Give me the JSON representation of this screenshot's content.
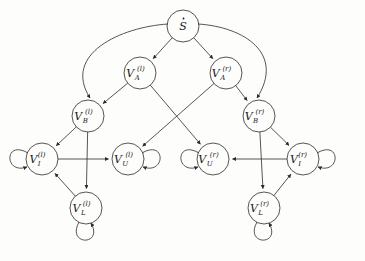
{
  "diagram": {
    "type": "directed-graph",
    "background_color": "#fdfdfc",
    "stroke_color": "#2b2b2b",
    "nodes": [
      {
        "id": "S",
        "label_main": "S",
        "label_sub": "",
        "label_sup": "",
        "accent": "dot",
        "cx": 183,
        "cy": 26,
        "r": 16
      },
      {
        "id": "Al",
        "label_main": "V",
        "label_sub": "A",
        "label_sup": "(l)",
        "accent": "",
        "cx": 140,
        "cy": 73,
        "r": 16
      },
      {
        "id": "Ar",
        "label_main": "V",
        "label_sub": "A",
        "label_sup": "(r)",
        "accent": "",
        "cx": 226,
        "cy": 73,
        "r": 16
      },
      {
        "id": "Bl",
        "label_main": "V",
        "label_sub": "B",
        "label_sup": "(l)",
        "accent": "",
        "cx": 88,
        "cy": 116,
        "r": 16
      },
      {
        "id": "Br",
        "label_main": "V",
        "label_sub": "B",
        "label_sup": "(r)",
        "accent": "",
        "cx": 259,
        "cy": 116,
        "r": 16
      },
      {
        "id": "Il",
        "label_main": "V",
        "label_sub": "I",
        "label_sup": "(l)",
        "accent": "",
        "cx": 42,
        "cy": 159,
        "r": 16
      },
      {
        "id": "Ul",
        "label_main": "V",
        "label_sub": "U",
        "label_sup": "(l)",
        "accent": "",
        "cx": 128,
        "cy": 159,
        "r": 16
      },
      {
        "id": "Ur",
        "label_main": "V",
        "label_sub": "U",
        "label_sup": "(r)",
        "accent": "",
        "cx": 213,
        "cy": 159,
        "r": 16
      },
      {
        "id": "Ir",
        "label_main": "V",
        "label_sub": "I",
        "label_sup": "(r)",
        "accent": "",
        "cx": 303,
        "cy": 159,
        "r": 16
      },
      {
        "id": "Ll",
        "label_main": "V",
        "label_sub": "L",
        "label_sup": "(l)",
        "accent": "",
        "cx": 86,
        "cy": 208,
        "r": 16
      },
      {
        "id": "Lr",
        "label_main": "V",
        "label_sub": "L",
        "label_sup": "(r)",
        "accent": "",
        "cx": 264,
        "cy": 208,
        "r": 16
      }
    ],
    "edges": [
      {
        "from": "S",
        "to": "Al",
        "kind": "straight"
      },
      {
        "from": "S",
        "to": "Ar",
        "kind": "straight"
      },
      {
        "from": "S",
        "to": "Bl",
        "kind": "curve-left"
      },
      {
        "from": "S",
        "to": "Br",
        "kind": "curve-right"
      },
      {
        "from": "Al",
        "to": "Bl",
        "kind": "straight"
      },
      {
        "from": "Ar",
        "to": "Br",
        "kind": "straight"
      },
      {
        "from": "Al",
        "to": "Ur",
        "kind": "cross"
      },
      {
        "from": "Ar",
        "to": "Ul",
        "kind": "cross"
      },
      {
        "from": "Bl",
        "to": "Il",
        "kind": "straight"
      },
      {
        "from": "Bl",
        "to": "Ll",
        "kind": "straight"
      },
      {
        "from": "Br",
        "to": "Ir",
        "kind": "straight"
      },
      {
        "from": "Br",
        "to": "Lr",
        "kind": "straight"
      },
      {
        "from": "Il",
        "to": "Ul",
        "kind": "straight"
      },
      {
        "from": "Ir",
        "to": "Ur",
        "kind": "straight"
      },
      {
        "from": "Ll",
        "to": "Il",
        "kind": "straight"
      },
      {
        "from": "Lr",
        "to": "Ir",
        "kind": "straight"
      }
    ],
    "self_loops": [
      {
        "node": "Il",
        "side": "left"
      },
      {
        "node": "Ul",
        "side": "right"
      },
      {
        "node": "Ur",
        "side": "left"
      },
      {
        "node": "Ir",
        "side": "right"
      },
      {
        "node": "Ll",
        "side": "bottom"
      },
      {
        "node": "Lr",
        "side": "bottom"
      }
    ]
  }
}
